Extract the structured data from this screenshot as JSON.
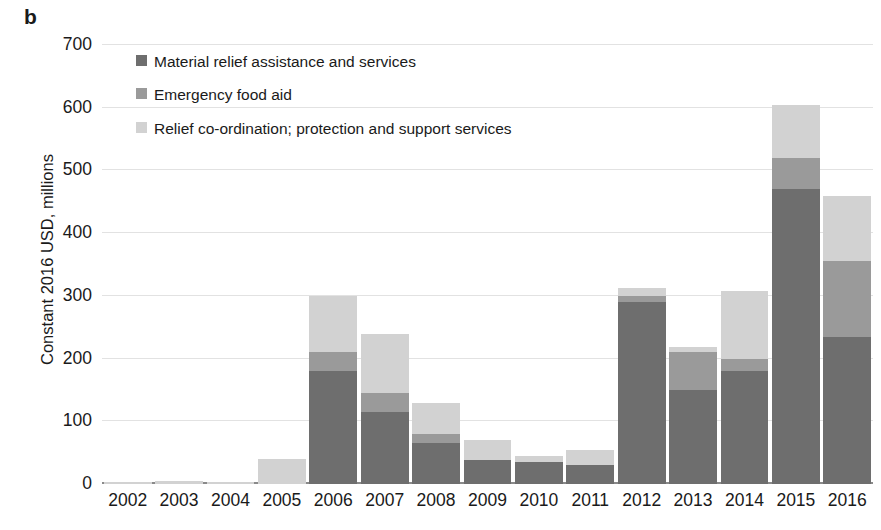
{
  "panel": {
    "label": "b"
  },
  "axes": {
    "y_title": "Constant 2016 USD, millions",
    "y_ticks": [
      "0",
      "100",
      "200",
      "300",
      "400",
      "500",
      "600",
      "700"
    ],
    "x_ticks": [
      "2002",
      "2003",
      "2004",
      "2005",
      "2006",
      "2007",
      "2008",
      "2009",
      "2010",
      "2011",
      "2012",
      "2013",
      "2014",
      "2015",
      "2016"
    ]
  },
  "legend": {
    "items": [
      {
        "label": "Material relief assistance and services",
        "color": "#6e6e6e",
        "swatch_name": "legend-swatch-material-relief"
      },
      {
        "label": "Emergency food aid",
        "color": "#9a9a9a",
        "swatch_name": "legend-swatch-emergency-food-aid"
      },
      {
        "label": "Relief co-ordination; protection and support services",
        "color": "#d2d2d2",
        "swatch_name": "legend-swatch-relief-coordination"
      }
    ]
  },
  "chart_data": {
    "type": "bar",
    "stacked": true,
    "title": "",
    "xlabel": "",
    "ylabel": "Constant 2016 USD, millions",
    "ylim": [
      0,
      700
    ],
    "ytick_values": [
      0,
      100,
      200,
      300,
      400,
      500,
      600,
      700
    ],
    "grid": true,
    "legend_position": "upper-left-inside",
    "categories": [
      "2002",
      "2003",
      "2004",
      "2005",
      "2006",
      "2007",
      "2008",
      "2009",
      "2010",
      "2011",
      "2012",
      "2013",
      "2014",
      "2015",
      "2016"
    ],
    "series": [
      {
        "name": "Material relief assistance and services",
        "color": "#6e6e6e",
        "values": [
          0,
          0,
          0,
          0,
          180,
          115,
          65,
          38,
          35,
          30,
          290,
          150,
          180,
          470,
          235
        ]
      },
      {
        "name": "Emergency food aid",
        "color": "#9a9a9a",
        "values": [
          0,
          0,
          0,
          0,
          30,
          30,
          15,
          0,
          0,
          0,
          10,
          60,
          20,
          50,
          120
        ]
      },
      {
        "name": "Relief co-ordination; protection and support services",
        "color": "#d2d2d2",
        "values": [
          3,
          5,
          1,
          40,
          90,
          95,
          50,
          32,
          10,
          25,
          13,
          8,
          107,
          85,
          105
        ]
      }
    ],
    "totals": [
      3,
      5,
      1,
      40,
      300,
      240,
      130,
      70,
      45,
      55,
      313,
      218,
      307,
      605,
      460
    ]
  },
  "colors": {
    "dark_gray": "#6e6e6e",
    "mid_gray": "#9a9a9a",
    "light_gray": "#d2d2d2",
    "gridline": "#e2e2e2",
    "axis": "#8a8a8a",
    "text": "#1a1a1a"
  }
}
